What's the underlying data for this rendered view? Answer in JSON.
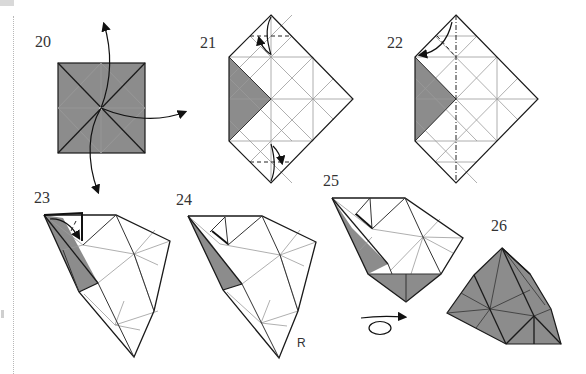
{
  "diagram": {
    "type": "origami-instructions",
    "steps": [
      {
        "id": "20",
        "label": "20",
        "description": "Square base shaded, center point with three curved arrows pointing out (up, right, down)"
      },
      {
        "id": "21",
        "label": "21",
        "description": "Diamond crease pattern, shaded left triangle, valley folds at top and bottom corners with arrows"
      },
      {
        "id": "22",
        "label": "22",
        "description": "Diamond crease pattern, dash-dot vertical mountain line, top corner folded down-left with arrow"
      },
      {
        "id": "23",
        "label": "23",
        "description": "Folded 3D shape, small flap folded with curved arrow at top-left"
      },
      {
        "id": "24",
        "label": "24",
        "description": "Folded 3D shape continued"
      },
      {
        "id": "25",
        "label": "25",
        "description": "Folded shape with shaded bottom triangle; turn-over symbol below"
      },
      {
        "id": "26",
        "label": "26",
        "description": "Finished shaded pyramid-like unit"
      }
    ],
    "annotations": {
      "right_label": "R",
      "turn_over_symbol": "turn-over-icon"
    },
    "colors": {
      "shade": "#8c8c8c",
      "line": "#1a1a1a",
      "crease": "#9a9a9a",
      "background": "#ffffff"
    }
  }
}
